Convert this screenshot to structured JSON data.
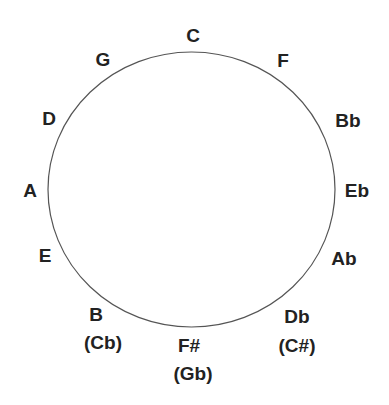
{
  "diagram": {
    "type": "circle-of-fifths",
    "circle": {
      "cx": 191.5,
      "cy": 189.5,
      "rx": 143.5,
      "ry": 137.5,
      "stroke": "#555555",
      "stroke_width": 1.2
    },
    "text_color": "#222222",
    "labels": [
      {
        "id": "c",
        "text": "C",
        "x": 193,
        "y": 42
      },
      {
        "id": "f",
        "text": "F",
        "x": 283,
        "y": 67
      },
      {
        "id": "bb",
        "text": "Bb",
        "x": 348,
        "y": 127
      },
      {
        "id": "eb",
        "text": "Eb",
        "x": 357,
        "y": 197
      },
      {
        "id": "ab",
        "text": "Ab",
        "x": 344,
        "y": 265
      },
      {
        "id": "db",
        "text": "Db",
        "x": 297,
        "y": 323
      },
      {
        "id": "c-sharp",
        "text": "(C#)",
        "x": 297,
        "y": 352
      },
      {
        "id": "f-sharp",
        "text": "F#",
        "x": 189,
        "y": 352
      },
      {
        "id": "gb",
        "text": "(Gb)",
        "x": 193,
        "y": 380
      },
      {
        "id": "b",
        "text": "B",
        "x": 96,
        "y": 321
      },
      {
        "id": "cb",
        "text": "(Cb)",
        "x": 103,
        "y": 349
      },
      {
        "id": "e",
        "text": "E",
        "x": 45,
        "y": 262
      },
      {
        "id": "a",
        "text": "A",
        "x": 30,
        "y": 197
      },
      {
        "id": "d",
        "text": "D",
        "x": 49,
        "y": 125
      },
      {
        "id": "g",
        "text": "G",
        "x": 103,
        "y": 66
      }
    ]
  }
}
